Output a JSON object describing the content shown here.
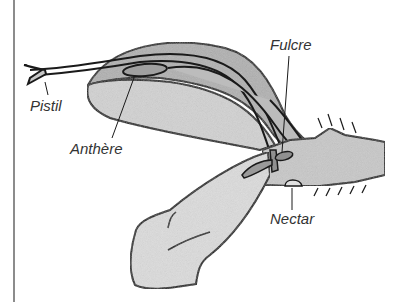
{
  "diagram": {
    "labels": {
      "pistil": "Pistil",
      "anthere": "Anthère",
      "fulcre": "Fulcre",
      "nectar": "Nectar"
    },
    "colors": {
      "outline": "#1a1a1a",
      "fill_dark": "#a8a8a8",
      "fill_mid": "#c4c4c4",
      "fill_light": "#dedede",
      "frame_line": "#8c8c8c"
    }
  }
}
